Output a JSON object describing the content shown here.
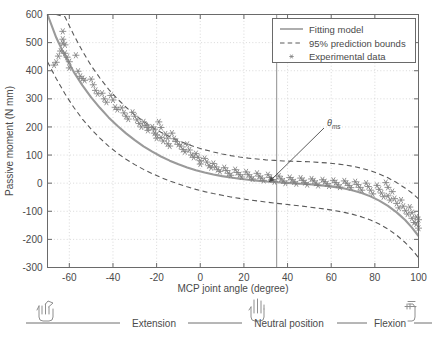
{
  "chart_data": {
    "type": "scatter",
    "title": "",
    "xlabel": "MCP joint angle (degree)",
    "ylabel": "Passive moment (N mm)",
    "xlim": [
      -70,
      100
    ],
    "ylim": [
      -300,
      600
    ],
    "xticks": [
      -60,
      -40,
      -20,
      0,
      20,
      40,
      60,
      80,
      100
    ],
    "yticks": [
      -300,
      -200,
      -100,
      0,
      100,
      200,
      300,
      400,
      500,
      600
    ],
    "grid": true,
    "legend_position": "top-right",
    "series": [
      {
        "name": "Fitting model",
        "type": "line",
        "color": "#9a9a9a",
        "x": [
          -70,
          -66,
          -62,
          -58,
          -54,
          -50,
          -46,
          -42,
          -38,
          -34,
          -30,
          -26,
          -22,
          -18,
          -14,
          -10,
          -6,
          -2,
          2,
          6,
          10,
          14,
          18,
          22,
          26,
          30,
          34,
          38,
          42,
          46,
          50,
          54,
          58,
          62,
          66,
          70,
          74,
          78,
          82,
          86,
          90,
          94,
          97,
          100
        ],
        "y": [
          600,
          518,
          452,
          396,
          348,
          305,
          268,
          234,
          204,
          177,
          153,
          131,
          112,
          95,
          80,
          67,
          56,
          46,
          38,
          31,
          25,
          20,
          16,
          12,
          9,
          6,
          4,
          2,
          0,
          -2,
          -4,
          -7,
          -10,
          -14,
          -19,
          -26,
          -35,
          -47,
          -62,
          -81,
          -104,
          -132,
          -158,
          -188
        ]
      },
      {
        "name": "95% prediction bounds upper",
        "type": "line-dashed",
        "color": "#5a5a5a",
        "x": [
          -70,
          -66,
          -62,
          -58,
          -54,
          -50,
          -46,
          -42,
          -38,
          -34,
          -30,
          -26,
          -22,
          -18,
          -14,
          -10,
          -6,
          -2,
          2,
          6,
          10,
          14,
          18,
          22,
          26,
          30,
          34,
          38,
          42,
          46,
          50,
          54,
          58,
          62,
          66,
          70,
          74,
          78,
          82,
          86,
          90,
          94,
          97,
          100
        ],
        "y": [
          600,
          600,
          592,
          528,
          470,
          418,
          374,
          334,
          300,
          270,
          243,
          220,
          199,
          181,
          165,
          151,
          139,
          128,
          119,
          111,
          104,
          98,
          93,
          89,
          86,
          83,
          81,
          79,
          78,
          77,
          76,
          74,
          72,
          69,
          65,
          60,
          53,
          44,
          33,
          19,
          2,
          -18,
          -35,
          -56
        ]
      },
      {
        "name": "95% prediction bounds lower",
        "type": "line-dashed",
        "color": "#5a5a5a",
        "x": [
          -70,
          -66,
          -62,
          -58,
          -54,
          -50,
          -46,
          -42,
          -38,
          -34,
          -30,
          -26,
          -22,
          -18,
          -14,
          -10,
          -6,
          -2,
          2,
          6,
          10,
          14,
          18,
          22,
          26,
          30,
          34,
          38,
          42,
          46,
          50,
          54,
          58,
          62,
          66,
          70,
          74,
          78,
          82,
          86,
          90,
          94,
          97,
          100
        ],
        "y": [
          432,
          372,
          318,
          270,
          228,
          192,
          160,
          132,
          107,
          85,
          66,
          49,
          34,
          20,
          8,
          -3,
          -13,
          -22,
          -30,
          -37,
          -43,
          -49,
          -54,
          -59,
          -63,
          -67,
          -71,
          -74,
          -78,
          -81,
          -85,
          -89,
          -93,
          -98,
          -104,
          -111,
          -120,
          -131,
          -145,
          -163,
          -185,
          -212,
          -236,
          -265
        ]
      },
      {
        "name": "Experimental data",
        "type": "scatter",
        "marker": "asterisk",
        "color": "#808080",
        "points": [
          [
            -63,
            540
          ],
          [
            -63,
            512
          ],
          [
            -63,
            498
          ],
          [
            -64,
            470
          ],
          [
            -65,
            452
          ],
          [
            -66,
            430
          ],
          [
            -67,
            420
          ],
          [
            -62,
            492
          ],
          [
            -62,
            462
          ],
          [
            -61,
            448
          ],
          [
            -60,
            432
          ],
          [
            -60,
            410
          ],
          [
            -57,
            455
          ],
          [
            -56,
            398
          ],
          [
            -55,
            380
          ],
          [
            -54,
            372
          ],
          [
            -53,
            366
          ],
          [
            -50,
            370
          ],
          [
            -49,
            350
          ],
          [
            -48,
            330
          ],
          [
            -47,
            318
          ],
          [
            -45,
            320
          ],
          [
            -44,
            300
          ],
          [
            -43,
            288
          ],
          [
            -41,
            312
          ],
          [
            -40,
            296
          ],
          [
            -39,
            270
          ],
          [
            -38,
            262
          ],
          [
            -36,
            268
          ],
          [
            -35,
            250
          ],
          [
            -34,
            238
          ],
          [
            -33,
            228
          ],
          [
            -31,
            252
          ],
          [
            -30,
            238
          ],
          [
            -29,
            225
          ],
          [
            -28,
            212
          ],
          [
            -27,
            200
          ],
          [
            -26,
            218
          ],
          [
            -25,
            205
          ],
          [
            -24,
            198
          ],
          [
            -24,
            188
          ],
          [
            -22,
            200
          ],
          [
            -21,
            192
          ],
          [
            -21,
            178
          ],
          [
            -20,
            172
          ],
          [
            -20,
            160
          ],
          [
            -19,
            218
          ],
          [
            -18,
            198
          ],
          [
            -18,
            162
          ],
          [
            -17,
            150
          ],
          [
            -16,
            175
          ],
          [
            -15,
            160
          ],
          [
            -15,
            140
          ],
          [
            -14,
            132
          ],
          [
            -13,
            178
          ],
          [
            -12,
            158
          ],
          [
            -11,
            148
          ],
          [
            -10,
            138
          ],
          [
            -9,
            132
          ],
          [
            -8,
            120
          ],
          [
            -7,
            112
          ],
          [
            -6,
            138
          ],
          [
            -5,
            118
          ],
          [
            -4,
            100
          ],
          [
            -3,
            92
          ],
          [
            -2,
            105
          ],
          [
            -1,
            92
          ],
          [
            0,
            80
          ],
          [
            0,
            68
          ],
          [
            2,
            88
          ],
          [
            3,
            75
          ],
          [
            4,
            62
          ],
          [
            5,
            55
          ],
          [
            6,
            70
          ],
          [
            7,
            58
          ],
          [
            8,
            48
          ],
          [
            9,
            42
          ],
          [
            11,
            55
          ],
          [
            12,
            45
          ],
          [
            13,
            35
          ],
          [
            14,
            28
          ],
          [
            16,
            48
          ],
          [
            17,
            38
          ],
          [
            18,
            30
          ],
          [
            19,
            22
          ],
          [
            21,
            40
          ],
          [
            22,
            30
          ],
          [
            23,
            22
          ],
          [
            24,
            15
          ],
          [
            26,
            35
          ],
          [
            27,
            25
          ],
          [
            28,
            18
          ],
          [
            29,
            10
          ],
          [
            31,
            30
          ],
          [
            32,
            20
          ],
          [
            33,
            12
          ],
          [
            34,
            5
          ],
          [
            36,
            25
          ],
          [
            37,
            15
          ],
          [
            38,
            8
          ],
          [
            39,
            0
          ],
          [
            41,
            20
          ],
          [
            42,
            12
          ],
          [
            43,
            5
          ],
          [
            44,
            -2
          ],
          [
            46,
            18
          ],
          [
            47,
            10
          ],
          [
            48,
            2
          ],
          [
            49,
            -5
          ],
          [
            51,
            15
          ],
          [
            52,
            8
          ],
          [
            53,
            0
          ],
          [
            54,
            -8
          ],
          [
            56,
            12
          ],
          [
            57,
            5
          ],
          [
            58,
            -2
          ],
          [
            59,
            -10
          ],
          [
            61,
            10
          ],
          [
            62,
            2
          ],
          [
            63,
            -6
          ],
          [
            64,
            -14
          ],
          [
            66,
            8
          ],
          [
            67,
            0
          ],
          [
            68,
            -8
          ],
          [
            69,
            -16
          ],
          [
            71,
            5
          ],
          [
            72,
            -5
          ],
          [
            73,
            -15
          ],
          [
            74,
            -25
          ],
          [
            76,
            0
          ],
          [
            77,
            -12
          ],
          [
            78,
            -25
          ],
          [
            79,
            -38
          ],
          [
            81,
            -8
          ],
          [
            82,
            -22
          ],
          [
            83,
            -35
          ],
          [
            84,
            -48
          ],
          [
            85,
            2
          ],
          [
            86,
            -15
          ],
          [
            86,
            -45
          ],
          [
            87,
            -60
          ],
          [
            88,
            -30
          ],
          [
            89,
            -55
          ],
          [
            90,
            -72
          ],
          [
            91,
            -88
          ],
          [
            92,
            -60
          ],
          [
            93,
            -82
          ],
          [
            94,
            -98
          ],
          [
            95,
            -110
          ],
          [
            96,
            -85
          ],
          [
            97,
            -105
          ],
          [
            97,
            -125
          ],
          [
            98,
            -140
          ],
          [
            99,
            -120
          ],
          [
            99,
            -145
          ],
          [
            100,
            -160
          ],
          [
            100,
            -130
          ]
        ]
      }
    ],
    "annotations": [
      {
        "name": "theta-ms",
        "label_theta": "θ",
        "label_sub": "ms",
        "x": 35,
        "y": 140,
        "points_to_x": 35,
        "points_to_y": 0
      }
    ],
    "vertical_marker": {
      "x": 35,
      "color": "#9a9a9a"
    }
  },
  "legend": {
    "items": [
      {
        "label": "Fitting model",
        "style": "solid"
      },
      {
        "label": "95% prediction bounds",
        "style": "dashed"
      },
      {
        "label": "Experimental data",
        "style": "marker"
      }
    ]
  },
  "footer": {
    "extension_label": "Extension",
    "neutral_label": "Neutral position",
    "flexion_label": "Flexion",
    "left_icon": "hand-extension-icon",
    "middle_icon": "hand-neutral-icon",
    "right_icon": "hand-flexion-icon"
  },
  "colors": {
    "fit_line": "#9a9a9a",
    "bounds": "#555555",
    "markers": "#858585",
    "grid": "#cfcfcf",
    "axis": "#6a6a6a",
    "text": "#4a4a4a"
  }
}
